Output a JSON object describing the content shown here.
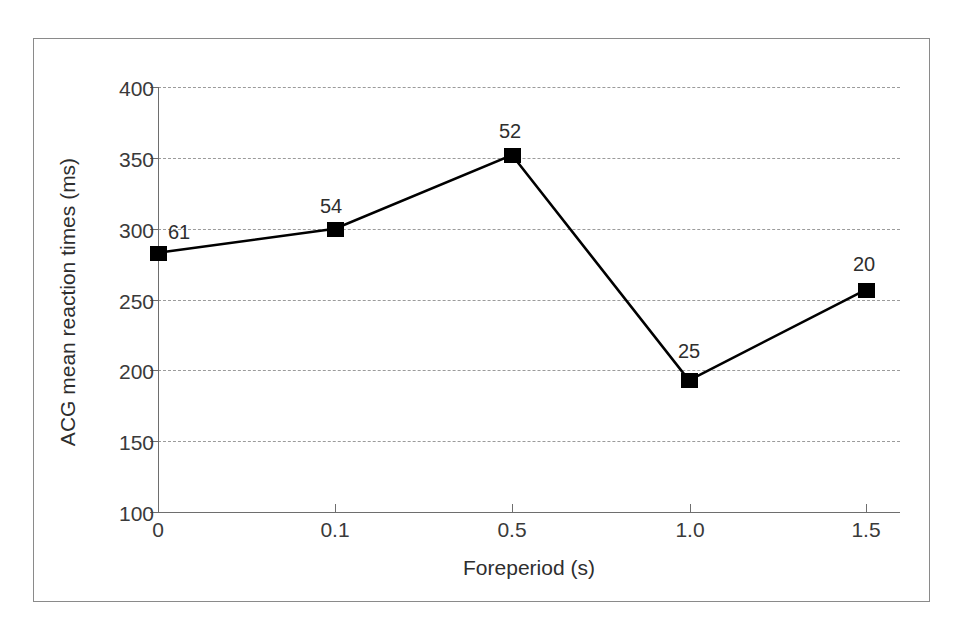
{
  "figure": {
    "background_color": "#ffffff",
    "frame_color": "#8a8a8a",
    "series_color": "#000000",
    "grid_color": "#9b9b9b"
  },
  "chart_data": {
    "type": "line",
    "title": "",
    "xlabel": "Foreperiod (s)",
    "ylabel": "ACG mean reaction times (ms)",
    "categories": [
      "0",
      "0.1",
      "0.5",
      "1.0",
      "1.5"
    ],
    "values": [
      283,
      300,
      352,
      193,
      257
    ],
    "point_labels": [
      "61",
      "54",
      "52",
      "25",
      "20"
    ],
    "ylim": [
      100,
      400
    ],
    "yticks": [
      100,
      150,
      200,
      250,
      300,
      350,
      400
    ],
    "ytick_labels": [
      "100",
      "150",
      "200",
      "250",
      "300",
      "350",
      "400"
    ],
    "xtick_labels": [
      "0",
      "0.1",
      "0.5",
      "1.0",
      "1.5"
    ],
    "grid": "horizontal-dashed",
    "legend": "none",
    "marker": "filled-square",
    "line_style": "solid"
  }
}
